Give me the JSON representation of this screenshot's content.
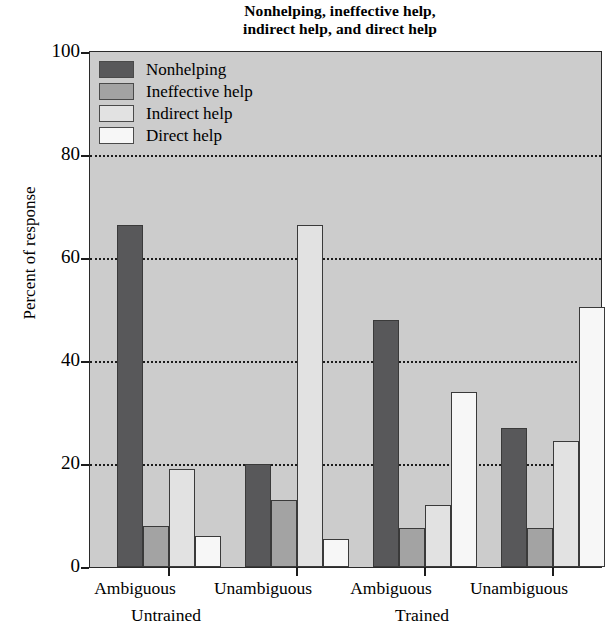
{
  "chart_data": {
    "type": "bar",
    "title": "Nonhelping, ineffective help, indirect help, and direct help",
    "title_lines": [
      "Nonhelping, ineffective help,",
      "indirect help, and direct help"
    ],
    "xlabel": "",
    "ylabel": "Percent of response",
    "ylim": [
      0,
      100
    ],
    "yticks": [
      0,
      20,
      40,
      60,
      80,
      100
    ],
    "ytick_labels": [
      "0",
      "20",
      "40",
      "60",
      "80",
      "100"
    ],
    "grid": "horizontal-dotted",
    "legend_position": "upper-left-inside",
    "categories": [
      "Ambiguous",
      "Unambiguous",
      "Ambiguous",
      "Unambiguous"
    ],
    "group_labels": [
      "Untrained",
      "Trained"
    ],
    "series": [
      {
        "name": "Nonhelping",
        "color": "#58585a",
        "values": [
          66.5,
          20.0,
          48.0,
          27.0
        ]
      },
      {
        "name": "Ineffective help",
        "color": "#a3a3a3",
        "values": [
          8.0,
          13.0,
          7.5,
          7.5
        ]
      },
      {
        "name": "Indirect help",
        "color": "#e2e2e2",
        "values": [
          19.0,
          66.5,
          12.0,
          24.5
        ]
      },
      {
        "name": "Direct help",
        "color": "#f7f7f7",
        "values": [
          6.0,
          5.5,
          34.0,
          50.5
        ]
      }
    ]
  },
  "legend": {
    "items": [
      {
        "label": "Nonhelping"
      },
      {
        "label": "Ineffective help"
      },
      {
        "label": "Indirect help"
      },
      {
        "label": "Direct help"
      }
    ]
  },
  "axes": {
    "y_title": "Percent of response",
    "y_labels": [
      "100",
      "80",
      "60",
      "40",
      "20",
      "0"
    ],
    "x_labels": [
      "Ambiguous",
      "Unambiguous",
      "Ambiguous",
      "Unambiguous"
    ],
    "x_group_labels": [
      "Untrained",
      "Trained"
    ]
  },
  "colors": {
    "plot_background": "#cccccc",
    "page_background": "#ffffff",
    "axis": "#1c1c1c",
    "gridline": "#1c1c1c"
  }
}
